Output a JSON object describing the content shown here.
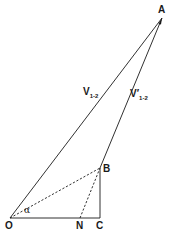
{
  "diagram": {
    "points": {
      "A": {
        "label": "A",
        "x": 162,
        "y": 18
      },
      "B": {
        "label": "B",
        "x": 100,
        "y": 168
      },
      "O": {
        "label": "O",
        "x": 10,
        "y": 218
      },
      "N": {
        "label": "N",
        "x": 80,
        "y": 218
      },
      "C": {
        "label": "C",
        "x": 100,
        "y": 218
      }
    },
    "vectors": {
      "OA": {
        "symbol": "V",
        "subscript": "1-2"
      },
      "BA": {
        "symbol": "V′",
        "subscript": "1-2"
      }
    },
    "angle": {
      "label": "α"
    },
    "line_color": "#1a1a1a"
  }
}
